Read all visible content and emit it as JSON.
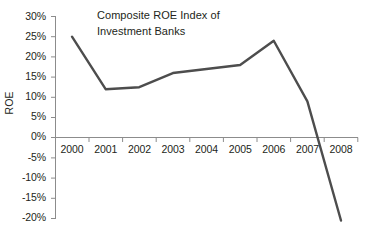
{
  "chart_data": {
    "type": "line",
    "title": "Composite ROE Index of\nInvestment Banks",
    "xlabel": "",
    "ylabel": "ROE",
    "categories": [
      "2000",
      "2001",
      "2002",
      "2003",
      "2004",
      "2005",
      "2006",
      "2007",
      "2008"
    ],
    "values": [
      25,
      12,
      12.5,
      16,
      17,
      18,
      24,
      9,
      -20.5
    ],
    "series": [
      {
        "name": "Composite ROE Index of Investment Banks",
        "values": [
          25,
          12,
          12.5,
          16,
          17,
          18,
          24,
          9,
          -20.5
        ]
      }
    ],
    "ylim": [
      -20,
      30
    ],
    "ytick_labels": [
      "30%",
      "25%",
      "20%",
      "15%",
      "10%",
      "5%",
      "0%",
      "-5%",
      "-10%",
      "-15%",
      "-20%"
    ],
    "ytick_values": [
      30,
      25,
      20,
      15,
      10,
      5,
      0,
      -5,
      -10,
      -15,
      -20
    ],
    "xtick_labels": [
      "2000",
      "2001",
      "2002",
      "2003",
      "2004",
      "2005",
      "2006",
      "2007",
      "2008"
    ],
    "grid": false,
    "legend": "none",
    "unit": "%",
    "colors": {
      "line": "#4d4d4d",
      "axis": "#8c8c8c",
      "text": "#231f20",
      "background": "#ffffff"
    }
  }
}
